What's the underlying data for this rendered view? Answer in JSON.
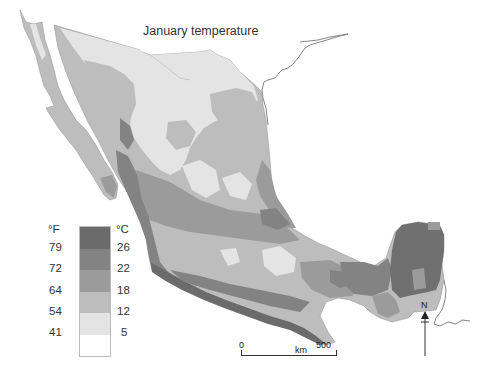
{
  "map": {
    "title": "January temperature",
    "region": "Mexico",
    "color_scheme": "grayscale"
  },
  "legend": {
    "unit_left": "°F",
    "unit_right": "°C",
    "bands": [
      {
        "color": "#6b6b6b",
        "label": ">26 °C / >79 °F"
      },
      {
        "color": "#838383",
        "label": "22–26 °C / 72–79 °F"
      },
      {
        "color": "#9b9b9b",
        "label": "18–22 °C / 64–72 °F"
      },
      {
        "color": "#bdbdbd",
        "label": "12–18 °C / 54–64 °F"
      },
      {
        "color": "#e4e4e4",
        "label": "5–12 °C / 41–54 °F"
      },
      {
        "color": "#ffffff",
        "label": "<5 °C / <41 °F"
      }
    ],
    "fahrenheit_ticks": [
      "79",
      "72",
      "64",
      "54",
      "41"
    ],
    "celsius_ticks": [
      "26",
      "22",
      "18",
      "12",
      "5"
    ]
  },
  "scale_bar": {
    "start": "0",
    "unit": "km",
    "end": "500"
  },
  "north_arrow": {
    "label": "N"
  }
}
